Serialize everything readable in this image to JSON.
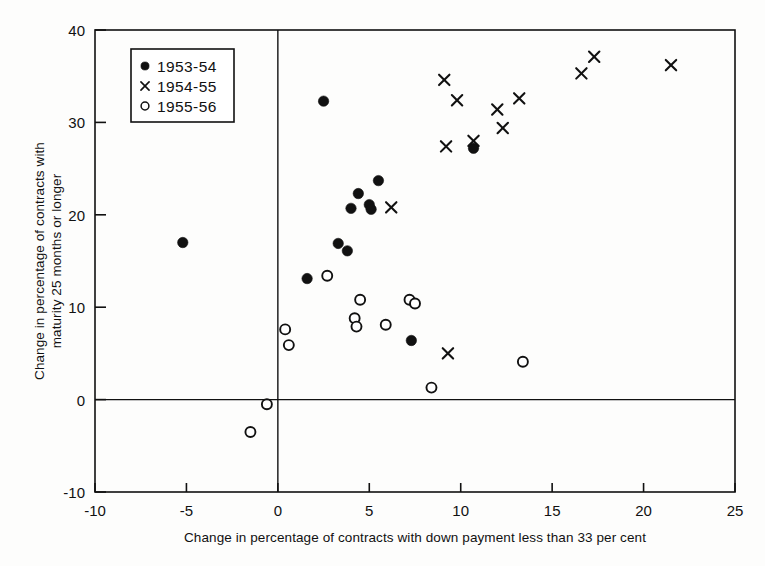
{
  "chart_data": {
    "type": "scatter",
    "title": "",
    "xlabel": "Change in percentage of contracts with down payment less than 33 per cent",
    "ylabel": "Change in percentage of contracts with maturity 25 months or longer",
    "xlim": [
      -10,
      25
    ],
    "ylim": [
      -10,
      40
    ],
    "xticks": [
      -10,
      -5,
      0,
      5,
      10,
      15,
      20,
      25
    ],
    "yticks": [
      -10,
      0,
      10,
      20,
      30,
      40
    ],
    "xtick_labels": [
      "-10",
      "-5",
      "0",
      "5",
      "10",
      "15",
      "20",
      "25"
    ],
    "ytick_labels": [
      "-10",
      "0",
      "10",
      "20",
      "30",
      "40"
    ],
    "grid": false,
    "zero_lines": true,
    "legend_position": "upper-left",
    "series": [
      {
        "name": "1953-54",
        "marker": "filled-circle",
        "color": "#111111",
        "points": [
          [
            -5.2,
            17.0
          ],
          [
            2.5,
            32.3
          ],
          [
            1.6,
            13.1
          ],
          [
            3.3,
            16.9
          ],
          [
            3.8,
            16.1
          ],
          [
            4.4,
            22.3
          ],
          [
            5.5,
            23.7
          ],
          [
            4.0,
            20.7
          ],
          [
            5.0,
            21.1
          ],
          [
            5.1,
            20.6
          ],
          [
            7.3,
            6.4
          ],
          [
            10.7,
            27.2
          ]
        ]
      },
      {
        "name": "1954-55",
        "marker": "cross",
        "color": "#111111",
        "points": [
          [
            6.2,
            20.8
          ],
          [
            9.1,
            34.6
          ],
          [
            9.8,
            32.4
          ],
          [
            10.7,
            28.0
          ],
          [
            9.2,
            27.4
          ],
          [
            12.0,
            31.4
          ],
          [
            12.3,
            29.4
          ],
          [
            13.2,
            32.6
          ],
          [
            16.6,
            35.3
          ],
          [
            17.3,
            37.1
          ],
          [
            21.5,
            36.2
          ],
          [
            9.3,
            5.0
          ]
        ]
      },
      {
        "name": "1955-56",
        "marker": "open-circle",
        "color": "#111111",
        "points": [
          [
            0.4,
            7.6
          ],
          [
            0.6,
            5.9
          ],
          [
            2.7,
            13.4
          ],
          [
            4.2,
            8.8
          ],
          [
            4.5,
            10.8
          ],
          [
            4.3,
            7.9
          ],
          [
            5.9,
            8.1
          ],
          [
            7.2,
            10.8
          ],
          [
            7.5,
            10.4
          ],
          [
            8.4,
            1.3
          ],
          [
            13.4,
            4.1
          ],
          [
            -0.6,
            -0.5
          ],
          [
            -1.5,
            -3.5
          ]
        ]
      }
    ],
    "legend": [
      {
        "marker": "filled-circle",
        "label": "1953-54"
      },
      {
        "marker": "cross",
        "label": "1954-55"
      },
      {
        "marker": "open-circle",
        "label": "1955-56"
      }
    ]
  }
}
